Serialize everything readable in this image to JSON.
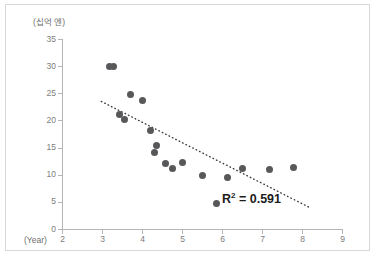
{
  "chart_data": {
    "type": "scatter",
    "title": "",
    "xlabel": "(Year)",
    "ylabel": "(십억 엔)",
    "xlim": [
      2,
      9
    ],
    "ylim": [
      0,
      35
    ],
    "grid": false,
    "legend": null,
    "xticks": [
      "2",
      "3",
      "4",
      "5",
      "6",
      "7",
      "8",
      "9"
    ],
    "yticks": [
      "0",
      "5",
      "10",
      "15",
      "20",
      "25",
      "30",
      "35"
    ],
    "xtick_values": [
      2,
      3,
      4,
      5,
      6,
      7,
      8,
      9
    ],
    "ytick_values": [
      0,
      5,
      10,
      15,
      20,
      25,
      30,
      35
    ],
    "series": [
      {
        "name": "observations",
        "marker": "circle",
        "color": "#58585a",
        "points": [
          {
            "x": 3.18,
            "y": 30.1
          },
          {
            "x": 3.27,
            "y": 30.1
          },
          {
            "x": 3.42,
            "y": 21.2
          },
          {
            "x": 3.56,
            "y": 20.2
          },
          {
            "x": 3.69,
            "y": 24.9
          },
          {
            "x": 3.99,
            "y": 23.8
          },
          {
            "x": 4.21,
            "y": 18.3
          },
          {
            "x": 4.35,
            "y": 15.5
          },
          {
            "x": 4.31,
            "y": 14.2
          },
          {
            "x": 4.58,
            "y": 12.1
          },
          {
            "x": 4.76,
            "y": 11.2
          },
          {
            "x": 5.01,
            "y": 12.3
          },
          {
            "x": 5.49,
            "y": 10.0
          },
          {
            "x": 5.85,
            "y": 4.7
          },
          {
            "x": 6.13,
            "y": 9.5
          },
          {
            "x": 6.51,
            "y": 11.3
          },
          {
            "x": 7.18,
            "y": 11.1
          },
          {
            "x": 7.78,
            "y": 11.4
          }
        ]
      }
    ],
    "trendline": {
      "style": "dotted",
      "color": "#3c3c3c",
      "x_start": 2.97,
      "y_start": 23.6,
      "x_end": 8.19,
      "y_end": 4.0
    },
    "annotations": [
      {
        "name": "r-squared",
        "text_prefix": "R",
        "text_superscript": "2",
        "text_suffix": " = 0.591",
        "value": 0.591
      }
    ]
  },
  "colors": {
    "marker": "#58585a",
    "axis": "#b5b5b5",
    "tick_text": "#7d7d7d",
    "frame_border": "#d8d8d8",
    "annotation_text": "#1c1c1c",
    "background": "#ffffff"
  }
}
